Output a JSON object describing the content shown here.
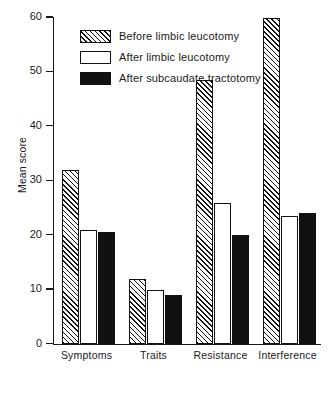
{
  "page": {
    "cropped_header_text": "with 4 and 4 of the it is their case it is a case of the case of the case"
  },
  "chart_data": {
    "type": "bar",
    "title": "",
    "xlabel": "",
    "ylabel": "Mean score",
    "ylim": [
      0,
      60
    ],
    "yticks": [
      0,
      10,
      20,
      30,
      40,
      50,
      60
    ],
    "ytick_labels": [
      "0",
      "10",
      "20",
      "30",
      "40",
      "50",
      "60"
    ],
    "grid": false,
    "legend_position": "upper-left-inside",
    "categories": [
      "Symptoms",
      "Traits",
      "Resistance",
      "Interference"
    ],
    "series": [
      {
        "name": "Before limbic leucotomy",
        "fill": "hatch",
        "values": [
          32,
          12,
          48.5,
          60
        ]
      },
      {
        "name": "After limbic leucotomy",
        "fill": "white",
        "values": [
          21,
          10,
          26,
          23.5
        ]
      },
      {
        "name": "After subcaudate tractotomy",
        "fill": "black",
        "values": [
          20.5,
          9,
          20,
          24
        ]
      }
    ]
  },
  "colors": {
    "ink": "#111111",
    "background": "#ffffff"
  }
}
